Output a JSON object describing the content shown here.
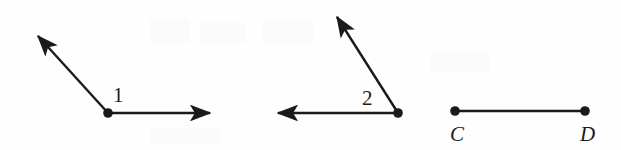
{
  "figure": {
    "width": 621,
    "height": 150,
    "background_color": "#fefefe",
    "ink_color": "#1a1a1a",
    "stroke_width": 2.4,
    "dot_radius": 4.6
  },
  "angle_one": {
    "label": "1",
    "label_x": 113,
    "label_y": 85,
    "vertex": {
      "x": 108,
      "y": 113
    },
    "rays": [
      {
        "name": "upper-left-ray",
        "tip_x": 34,
        "tip_y": 32,
        "arrow": true
      },
      {
        "name": "right-ray",
        "tip_x": 216,
        "tip_y": 113,
        "arrow": true
      }
    ]
  },
  "angle_two": {
    "label": "2",
    "label_x": 362,
    "label_y": 88,
    "vertex": {
      "x": 398,
      "y": 113
    },
    "rays": [
      {
        "name": "upper-left-ray",
        "tip_x": 333,
        "tip_y": 11,
        "arrow": true
      },
      {
        "name": "left-ray",
        "tip_x": 272,
        "tip_y": 113,
        "arrow": true
      }
    ]
  },
  "segment_cd": {
    "start_label": "C",
    "end_label": "D",
    "start_point": {
      "x": 455,
      "y": 111
    },
    "end_point": {
      "x": 585,
      "y": 111
    },
    "start_label_x": 450,
    "start_label_y": 124,
    "end_label_x": 580,
    "end_label_y": 124
  }
}
